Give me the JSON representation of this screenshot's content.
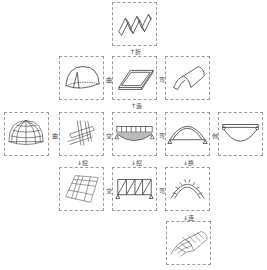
{
  "diagram": {
    "title": "",
    "nodes": [
      {
        "id": "folded-plate",
        "icon": "folded-plate-icon"
      },
      {
        "id": "dome-shell",
        "icon": "dome-shell-icon"
      },
      {
        "id": "flat-plate",
        "icon": "flat-plate-icon"
      },
      {
        "id": "barrel-shell",
        "icon": "barrel-shell-icon"
      },
      {
        "id": "geodesic-dome",
        "icon": "grid-dome-icon"
      },
      {
        "id": "cross-beams",
        "icon": "cross-beams-icon"
      },
      {
        "id": "loaded-beam",
        "icon": "loaded-beam-icon"
      },
      {
        "id": "arch",
        "icon": "arch-icon"
      },
      {
        "id": "suspension",
        "icon": "suspension-cable-icon"
      },
      {
        "id": "grid-slab",
        "icon": "grid-slab-icon"
      },
      {
        "id": "truss",
        "icon": "truss-icon"
      },
      {
        "id": "segmented-arch",
        "icon": "segmented-arch-icon"
      },
      {
        "id": "lattice-vault",
        "icon": "lattice-vault-icon"
      }
    ],
    "edges": [
      {
        "from": "flat-plate",
        "to": "folded-plate",
        "label": "↑折"
      },
      {
        "from": "flat-plate",
        "to": "dome-shell",
        "label": "曲"
      },
      {
        "from": "flat-plate",
        "to": "barrel-shell",
        "label": "弯"
      },
      {
        "from": "loaded-beam",
        "to": "flat-plate",
        "label": "↑造"
      },
      {
        "from": "cross-beams",
        "to": "geodesic-dome",
        "label": "曲"
      },
      {
        "from": "loaded-beam",
        "to": "cross-beams",
        "label": "交"
      },
      {
        "from": "loaded-beam",
        "to": "arch",
        "label": "弯"
      },
      {
        "from": "arch",
        "to": "suspension",
        "label": "倒"
      },
      {
        "from": "cross-beams",
        "to": "grid-slab",
        "label": "↓挖"
      },
      {
        "from": "loaded-beam",
        "to": "truss",
        "label": "↓挖"
      },
      {
        "from": "arch",
        "to": "segmented-arch",
        "label": "↓换"
      },
      {
        "from": "truss",
        "to": "grid-slab",
        "label": "交"
      },
      {
        "from": "truss",
        "to": "segmented-arch",
        "label": "弯"
      },
      {
        "from": "segmented-arch",
        "to": "lattice-vault",
        "label": "↓连"
      }
    ],
    "labels": {
      "fold": "↑折",
      "curve_left_top": "曲",
      "bend_right_top": "弯",
      "build": "↑造",
      "curve_left_mid": "曲",
      "cross_mid": "交",
      "bend_mid": "弯",
      "invert": "倒",
      "dig_left": "↓挖",
      "dig_mid": "↓挖",
      "swap": "↓换",
      "cross_bot": "交",
      "bend_bot": "弯",
      "connect": "↓连"
    }
  }
}
